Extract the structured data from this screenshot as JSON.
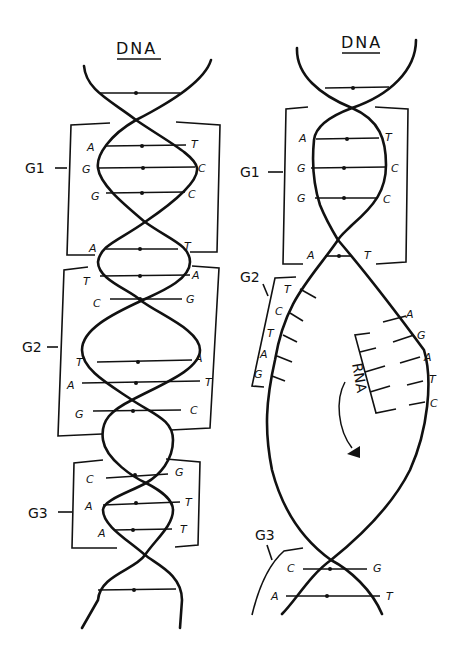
{
  "left_diagram": {
    "title": "DNA",
    "groups": [
      {
        "label": "G1",
        "pairs": [
          [
            "A",
            "T"
          ],
          [
            "G",
            "C"
          ],
          [
            "G",
            "C"
          ],
          [
            "A",
            "T"
          ]
        ]
      },
      {
        "label": "G2",
        "pairs": [
          [
            "T",
            "A"
          ],
          [
            "C",
            "G"
          ],
          [
            "T",
            "A"
          ],
          [
            "A",
            "T"
          ],
          [
            "G",
            "C"
          ]
        ]
      },
      {
        "label": "G3",
        "pairs": [
          [
            "C",
            "G"
          ],
          [
            "A",
            "T"
          ],
          [
            "A",
            "T"
          ]
        ]
      }
    ]
  },
  "right_diagram": {
    "title": "DNA",
    "groups": [
      {
        "label": "G1",
        "pairs": [
          [
            "A",
            "T"
          ],
          [
            "G",
            "C"
          ],
          [
            "G",
            "C"
          ],
          [
            "A",
            "T"
          ]
        ]
      },
      {
        "label": "G2",
        "template_bases": [
          "T",
          "C",
          "T",
          "A",
          "G"
        ]
      },
      {
        "label": "G3",
        "pairs": [
          [
            "C",
            "G"
          ],
          [
            "A",
            "T"
          ]
        ]
      }
    ],
    "coding_strand_bases": [
      "A",
      "G",
      "A",
      "T",
      "C"
    ],
    "rna_label": "RNA"
  }
}
